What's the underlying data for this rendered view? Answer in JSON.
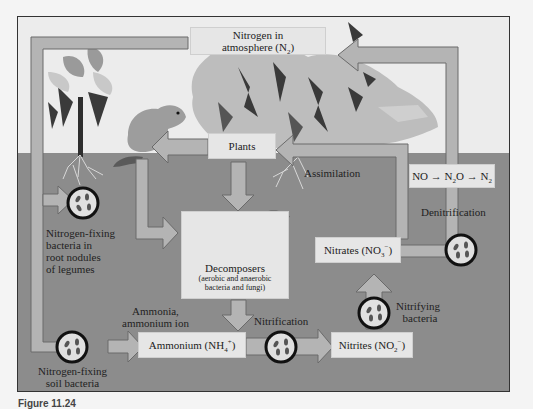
{
  "diagram": {
    "colors": {
      "sky": "#ececec",
      "soil": "#8c8c8c",
      "arrow_fill": "#b4b4b4",
      "arrow_stroke": "#6a6a6a",
      "box_fill": "#e6e6e6",
      "bacteria_ring": "#111111"
    },
    "nodes": {
      "atmosphere": {
        "line1": "Nitrogen in",
        "line2": "atmosphere (N",
        "sub": "2",
        "close": ")"
      },
      "plants": {
        "label": "Plants"
      },
      "decomposers": {
        "label": "Decomposers",
        "detail_line1": "(aerobic and anaerobic",
        "detail_line2": "bacteria and fungi)"
      },
      "ammonium": {
        "label": "Ammonium (NH",
        "sub": "4",
        "sup": "+",
        "close": ")"
      },
      "nitrites": {
        "label": "Nitrites (NO",
        "sub": "2",
        "sup": "−",
        "close": ")"
      },
      "nitrates": {
        "label": "Nitrates (NO",
        "sub": "3",
        "sup": "−",
        "close": ")"
      },
      "denitrification_chain": {
        "a": "NO",
        "arrow1": "→",
        "b": "N",
        "b_sub": "2",
        "b_tail": "O",
        "arrow2": "→",
        "c": "N",
        "c_sub": "2"
      }
    },
    "process_labels": {
      "assimilation": "Assimilation",
      "denitrification": "Denitrification",
      "nitrification": "Nitrification",
      "nitrifying_bacteria_line1": "Nitrifying",
      "nitrifying_bacteria_line2": "bacteria",
      "ammonia_line1": "Ammonia,",
      "ammonia_line2": "ammonium ion",
      "root_nodule_line1": "Nitrogen-fixing",
      "root_nodule_line2": "bacteria in",
      "root_nodule_line3": "root nodules",
      "root_nodule_line4": "of legumes",
      "soil_bacteria_line1": "Nitrogen-fixing",
      "soil_bacteria_line2": "soil bacteria"
    },
    "icons": [
      "bacteria-icon",
      "mushroom-icon",
      "tree-icon",
      "legume-plant-icon",
      "squirrel-icon",
      "roots-icon"
    ]
  },
  "caption": "Figure 11.24"
}
